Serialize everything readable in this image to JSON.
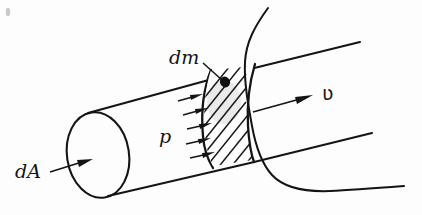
{
  "figure": {
    "background_color": "#fdfdfd",
    "ink_color": "#141414",
    "width": 422,
    "height": 215
  },
  "labels": {
    "area": "dA",
    "pressure": "p",
    "mass_element": "dm",
    "velocity": "ʋ"
  },
  "annotations": {
    "area_arrow": "arrow entering left end cap",
    "pressure_arrows_count": 5,
    "velocity_arrow": "arrow pointing downstream to the right",
    "leader_note": "leader line from dm label to hatched slab"
  },
  "parts": {
    "left_cap": "elliptical end cap",
    "tube_top_edge": "upper tube wall",
    "tube_bottom_edge": "lower tube wall",
    "inner_cap": "curved cross-section face",
    "hatched_slab": "mass element slab with diagonal hatching",
    "break_curve": "wavy break line showing tube continues"
  }
}
